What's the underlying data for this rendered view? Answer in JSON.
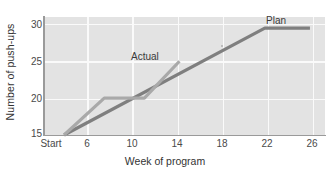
{
  "chart_data": {
    "type": "line",
    "title": "",
    "xlabel": "Week of program",
    "ylabel": "Number of push-ups",
    "xlim": [
      0,
      28
    ],
    "ylim": [
      15,
      31
    ],
    "grid": true,
    "legend_position": "inline-annotations",
    "x_tick_values": [
      2,
      6,
      10,
      14,
      18,
      22,
      26
    ],
    "x_tick_labels": [
      "Start",
      "6",
      "10",
      "14",
      "18",
      "22",
      "26"
    ],
    "y_tick_values": [
      15,
      20,
      25,
      30
    ],
    "y_tick_labels": [
      "15",
      "20",
      "25",
      "30"
    ],
    "series": [
      {
        "name": "Actual",
        "color": "#a9a9a9",
        "x": [
          2,
          6,
          10,
          13.5
        ],
        "values": [
          15,
          20,
          20,
          25
        ]
      },
      {
        "name": "Plan",
        "color": "#7f7f7f",
        "x": [
          2,
          22,
          26.5
        ],
        "values": [
          15,
          29.5,
          29.5
        ]
      }
    ],
    "annotations": [
      {
        "text": "Actual",
        "x": 11.1,
        "y": 25.9
      },
      {
        "text": "Plan",
        "x": 22.0,
        "y": 30.9
      }
    ]
  },
  "axes": {
    "x_title": "Week of program",
    "y_title": "Number of push-ups",
    "x_ticks": [
      "Start",
      "6",
      "10",
      "14",
      "18",
      "22",
      "26"
    ],
    "y_ticks": [
      "30",
      "25",
      "20",
      "15"
    ]
  },
  "colors": {
    "plot_background": "#e3e3e3",
    "gridline": "#fafafa",
    "axis": "#9a9a9a",
    "actual_line": "#a9a9a9",
    "plan_line": "#7f7f7f",
    "text": "#3a3a3a"
  },
  "labels": {
    "actual": "Actual",
    "plan": "Plan"
  }
}
